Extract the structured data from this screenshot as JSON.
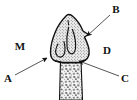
{
  "figure": {
    "kind": "anatomical-line-drawing",
    "background_color": "#ffffff",
    "ink_color": "#111111",
    "crown": {
      "name": "crown",
      "fill_color": "#e9e9e9",
      "texture": "stipple-dots",
      "outline_color": "#111111"
    },
    "root": {
      "name": "root",
      "fill_color": "#f2f2f2",
      "texture": "speckle-mottled",
      "outline_color": "#111111"
    }
  },
  "labels": [
    {
      "id": "M",
      "text": "M",
      "x": 20,
      "y": 47,
      "has_leader_line": false,
      "has_arrowhead": false
    },
    {
      "id": "A",
      "text": "A",
      "x": 8,
      "y": 79,
      "has_leader_line": true,
      "has_arrowhead": true,
      "leader_from_x": 15,
      "leader_from_y": 75,
      "leader_to_x": 47,
      "leader_to_y": 58
    },
    {
      "id": "B",
      "text": "B",
      "x": 116,
      "y": 10,
      "has_leader_line": true,
      "has_arrowhead": true,
      "leader_from_x": 110,
      "leader_from_y": 15,
      "leader_to_x": 87,
      "leader_to_y": 36
    },
    {
      "id": "C",
      "text": "C",
      "x": 125,
      "y": 79,
      "has_leader_line": true,
      "has_arrowhead": true,
      "leader_from_x": 119,
      "leader_from_y": 76,
      "leader_to_x": 79,
      "leader_to_y": 61
    },
    {
      "id": "D",
      "text": "D",
      "x": 107,
      "y": 51,
      "has_leader_line": false,
      "has_arrowhead": false
    }
  ]
}
